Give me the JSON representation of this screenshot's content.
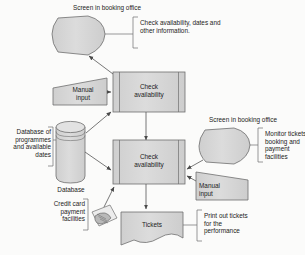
{
  "diagram": {
    "background_color": "#fbfbfa",
    "shape_fill": "#d9d9d9",
    "shape_stroke": "#6e6e6e",
    "line_color": "#555555",
    "text_color": "#1b1b1b"
  },
  "captions": {
    "screen_top": "Screen in booking office",
    "screen_right": "Screen in booking office",
    "database_caption": "Database"
  },
  "notes": {
    "check_availability_note": "Check availability, dates and\nother information.",
    "monitor_note": "Monitor tickets\nbooking and\npayment facilities",
    "print_note": "Print out tickets\nfor the\nperformance",
    "database_note": "Database of\nprogrammes\nand available\ndates",
    "credit_note": "Credit card\npayment\nfacilities"
  },
  "nodes": {
    "process_top": "Check\navailability",
    "process_bottom": "Check\navailability",
    "manual_input_left": "Manual\ninput",
    "manual_input_right": "Manual\ninput",
    "tickets": "Tickets"
  },
  "icons": {
    "screen_top": "display-screen-icon",
    "screen_right": "display-screen-icon",
    "database": "database-cylinder-icon",
    "manual_left": "manual-input-icon",
    "manual_right": "manual-input-icon",
    "credit_card": "hand-with-credit-card-icon",
    "tickets": "document-icon",
    "process_top": "predefined-process-icon",
    "process_bottom": "predefined-process-icon"
  }
}
